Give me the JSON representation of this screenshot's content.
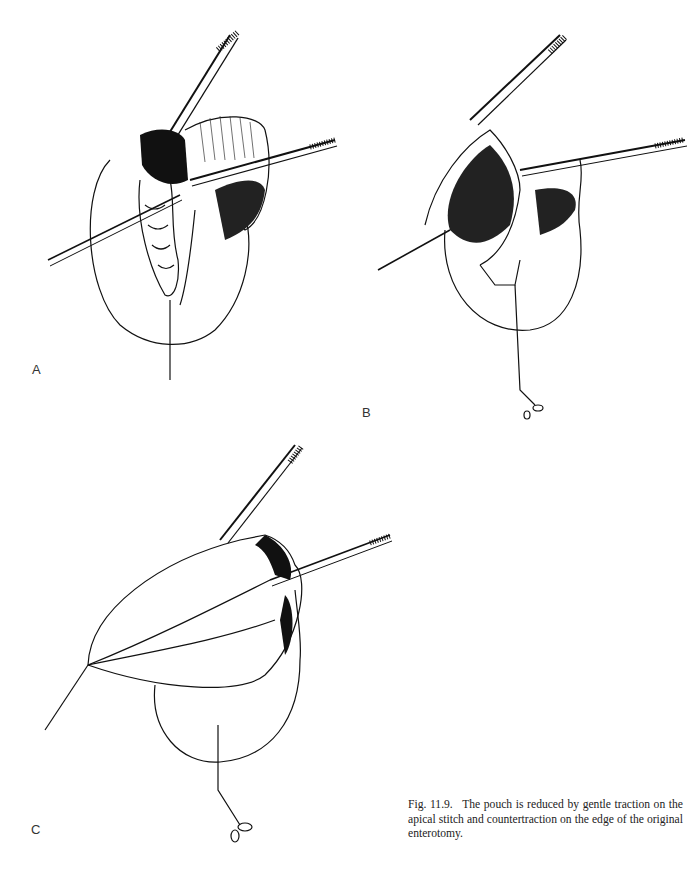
{
  "figure": {
    "panels": [
      {
        "id": "A",
        "label": "A",
        "description": "Pouch held open with two forceps; everted mucosal folds visible at the enterotomy, traction suture below"
      },
      {
        "id": "B",
        "label": "B",
        "description": "Pouch partially reduced with gentle traction on the apical stitch; forceps at the enterotomy edge"
      },
      {
        "id": "C",
        "label": "C",
        "description": "Pouch further reduced by traction on apical stitch and countertraction on the edge of the enterotomy"
      }
    ],
    "caption": {
      "number": "Fig. 11.9.",
      "text": "The pouch is reduced by gentle traction on the apical stitch and countertraction on the edge of the original enterotomy."
    }
  },
  "colors": {
    "ink": "#111111",
    "background": "#ffffff"
  }
}
